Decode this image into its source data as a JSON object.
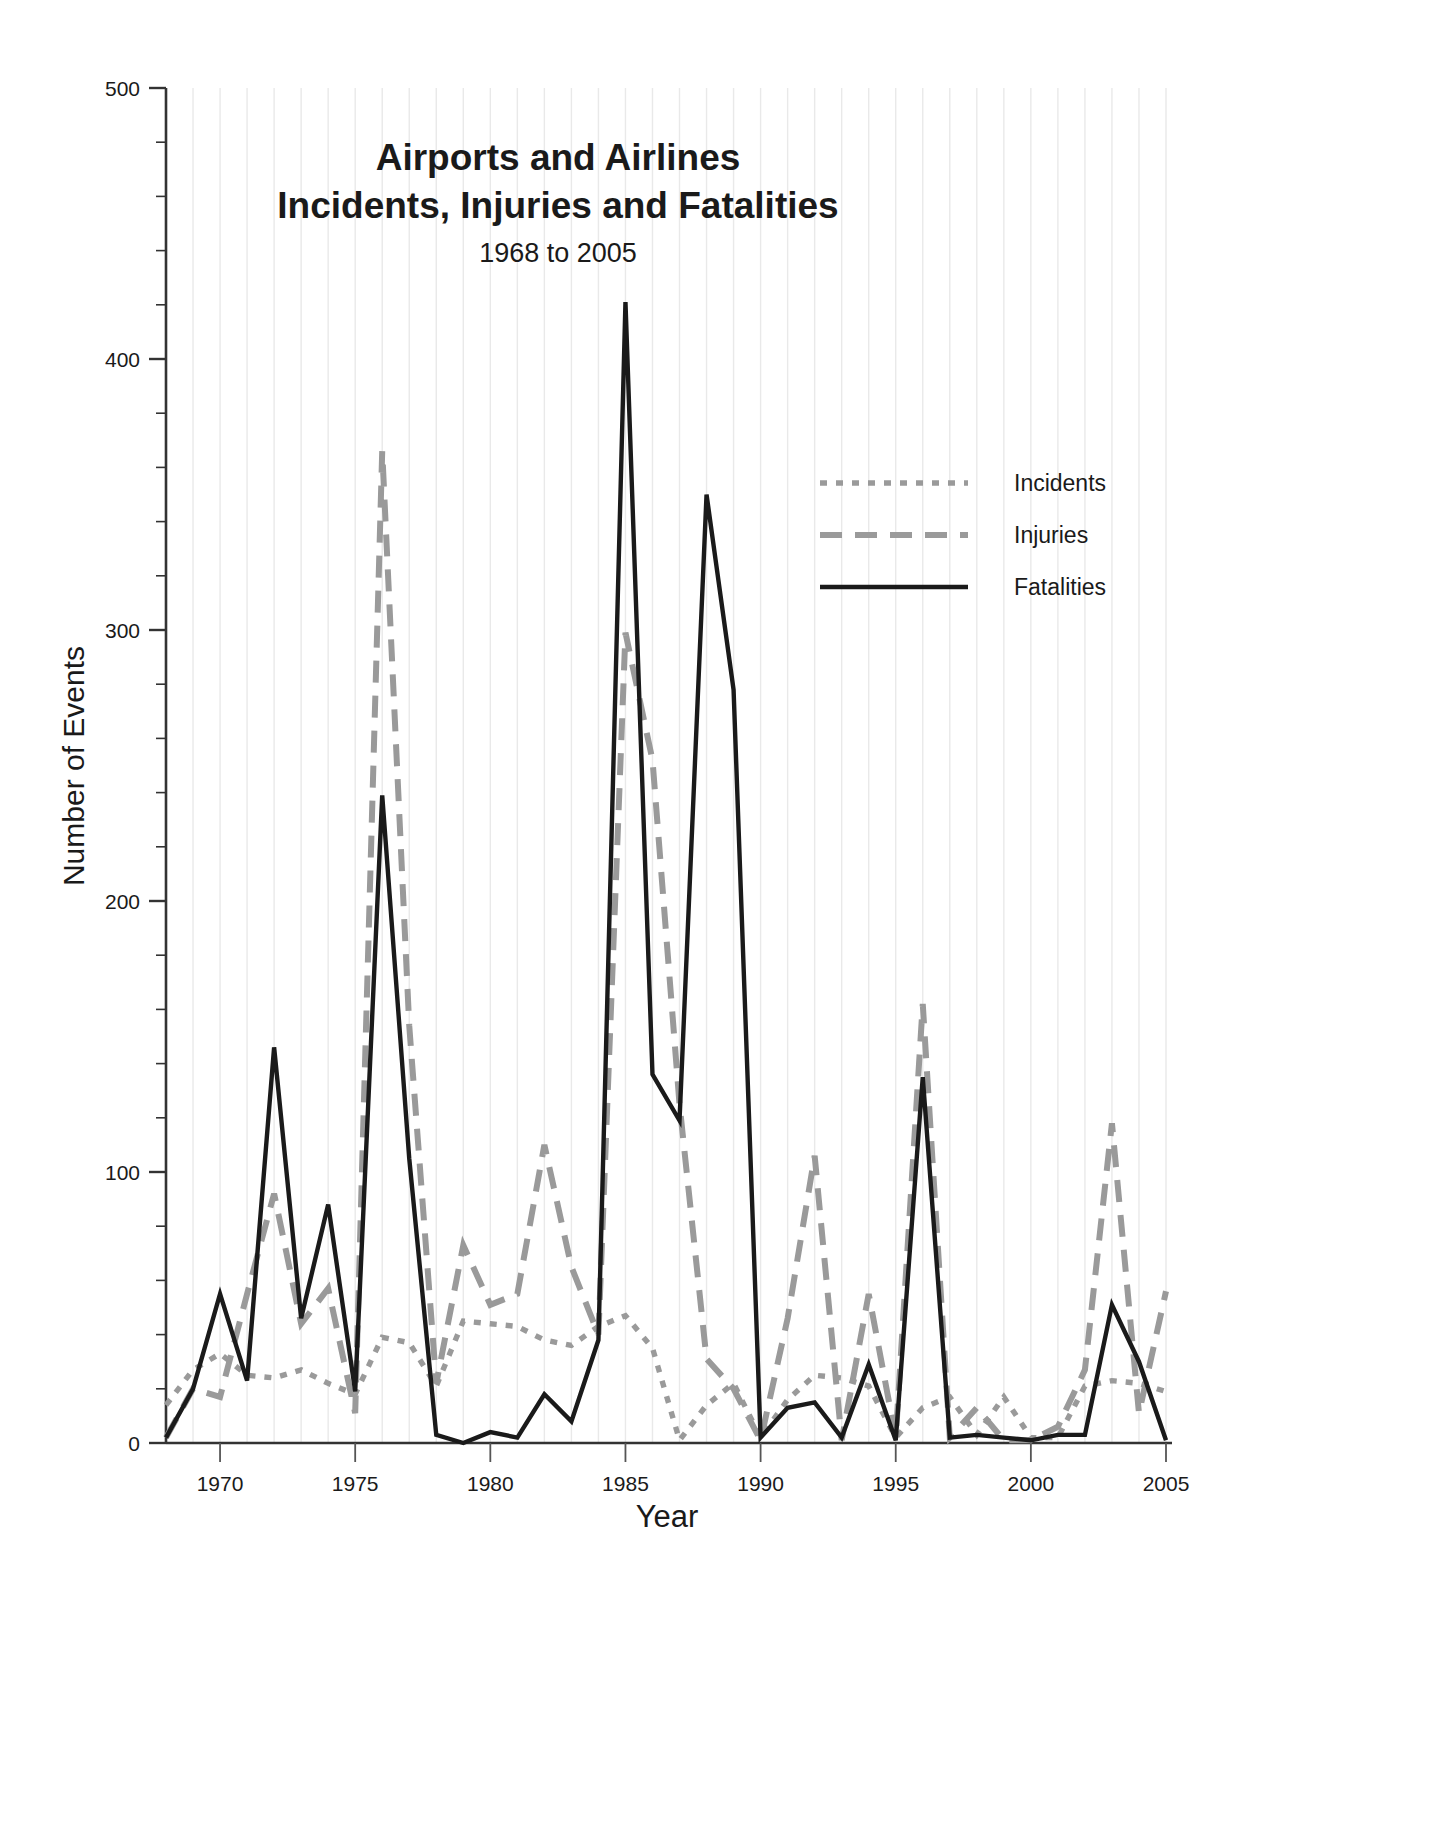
{
  "chart_data": {
    "type": "line",
    "title": [
      "Airports and Airlines",
      "Incidents, Injuries and Fatalities"
    ],
    "title_line1": "Airports and Airlines",
    "title_line2": "Incidents, Injuries and Fatalities",
    "subtitle": "1968 to 2005",
    "xlabel": "Year",
    "ylabel": "Number of Events",
    "xlim": [
      1968,
      2005
    ],
    "ylim": [
      0,
      500
    ],
    "ytick_labels": [
      "0",
      "100",
      "200",
      "300",
      "400",
      "500"
    ],
    "ytick_values": [
      0,
      100,
      200,
      300,
      400,
      500
    ],
    "ytick_minor_step": 20,
    "xtick_labels": [
      "1970",
      "1975",
      "1980",
      "1985",
      "1990",
      "1995",
      "2000",
      "2005"
    ],
    "xtick_values": [
      1970,
      1975,
      1980,
      1985,
      1990,
      1995,
      2000,
      2005
    ],
    "grid": "vertical light gridlines at every year",
    "legend_position": "upper right inside plot",
    "x": [
      1968,
      1969,
      1970,
      1971,
      1972,
      1973,
      1974,
      1975,
      1976,
      1977,
      1978,
      1979,
      1980,
      1981,
      1982,
      1983,
      1984,
      1985,
      1986,
      1987,
      1988,
      1989,
      1990,
      1991,
      1992,
      1993,
      1994,
      1995,
      1996,
      1997,
      1998,
      1999,
      2000,
      2001,
      2002,
      2003,
      2004,
      2005
    ],
    "series": [
      {
        "name": "Incidents",
        "style": "dotted",
        "color": "#9a9a9a",
        "values": [
          14,
          27,
          33,
          25,
          24,
          27,
          22,
          18,
          39,
          37,
          21,
          45,
          44,
          43,
          38,
          36,
          43,
          47,
          35,
          1,
          14,
          22,
          2,
          16,
          25,
          24,
          21,
          2,
          13,
          17,
          3,
          17,
          2,
          2,
          21,
          23,
          22,
          19
        ]
      },
      {
        "name": "Injuries",
        "style": "dashed",
        "color": "#9a9a9a",
        "values": [
          2,
          20,
          17,
          55,
          92,
          44,
          57,
          11,
          366,
          154,
          22,
          73,
          51,
          55,
          110,
          65,
          40,
          299,
          252,
          125,
          31,
          20,
          1,
          46,
          106,
          1,
          55,
          2,
          162,
          2,
          13,
          1,
          1,
          6,
          27,
          118,
          11,
          56
        ]
      },
      {
        "name": "Fatalities",
        "style": "solid",
        "color": "#1a1a1a",
        "values": [
          2,
          20,
          55,
          23,
          146,
          46,
          88,
          19,
          239,
          105,
          3,
          0,
          4,
          2,
          18,
          8,
          38,
          421,
          136,
          119,
          350,
          278,
          2,
          13,
          15,
          2,
          29,
          1,
          135,
          2,
          3,
          2,
          1,
          3,
          3,
          51,
          30,
          1
        ]
      }
    ]
  },
  "legend": {
    "items": [
      {
        "label": "Incidents"
      },
      {
        "label": "Injuries"
      },
      {
        "label": "Fatalities"
      }
    ]
  }
}
